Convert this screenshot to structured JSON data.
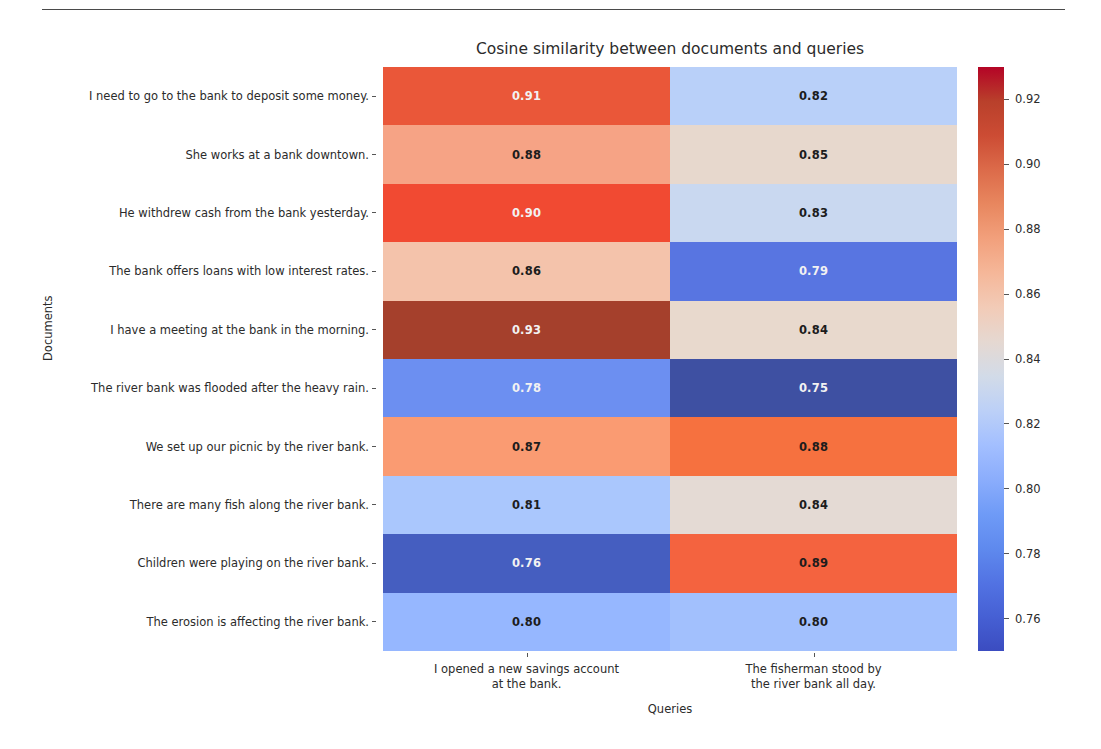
{
  "figure": {
    "title": "Cosine similarity between documents and queries",
    "xlabel": "Queries",
    "ylabel": "Documents",
    "divider": "horizontal-rule"
  },
  "chart_data": {
    "type": "heatmap",
    "title": "Cosine similarity between documents and queries",
    "xlabel": "Queries",
    "ylabel": "Documents",
    "grid": false,
    "colormap": "coolwarm",
    "vmin": 0.75,
    "vmax": 0.93,
    "colorbar": {
      "position": "right",
      "ticks": [
        0.76,
        0.78,
        0.8,
        0.82,
        0.84,
        0.86,
        0.88,
        0.9,
        0.92
      ],
      "ticklabels": [
        "0.76",
        "0.78",
        "0.80",
        "0.82",
        "0.84",
        "0.86",
        "0.88",
        "0.90",
        "0.92"
      ],
      "low_color": "#3b4cc0",
      "mid_color": "#dddcdb",
      "high_color": "#b40426"
    },
    "x_categories": [
      "I opened a new savings account at the bank.",
      "The fisherman stood by the river bank all day."
    ],
    "x_ticklabels": [
      [
        "I opened a new savings account",
        "at the bank."
      ],
      [
        "The fisherman stood by",
        "the river bank all day."
      ]
    ],
    "y_categories": [
      "I need to go to the bank to deposit some money.",
      "She works at a bank downtown.",
      "He withdrew cash from the bank yesterday.",
      "The bank offers loans with low interest rates.",
      "I have a meeting at the bank in the morning.",
      "The river bank was flooded after the heavy rain.",
      "We set up our picnic by the river bank.",
      "There are many fish along the river bank.",
      "Children were playing on the river bank.",
      "The erosion is affecting the river bank."
    ],
    "values": [
      [
        0.91,
        0.82
      ],
      [
        0.88,
        0.85
      ],
      [
        0.9,
        0.83
      ],
      [
        0.86,
        0.79
      ],
      [
        0.93,
        0.84
      ],
      [
        0.78,
        0.75
      ],
      [
        0.87,
        0.88
      ],
      [
        0.81,
        0.84
      ],
      [
        0.76,
        0.89
      ],
      [
        0.8,
        0.8
      ]
    ],
    "annotations": [
      [
        "0.91",
        "0.82"
      ],
      [
        "0.88",
        "0.85"
      ],
      [
        "0.90",
        "0.83"
      ],
      [
        "0.86",
        "0.79"
      ],
      [
        "0.93",
        "0.84"
      ],
      [
        "0.78",
        "0.75"
      ],
      [
        "0.87",
        "0.88"
      ],
      [
        "0.81",
        "0.84"
      ],
      [
        "0.76",
        "0.89"
      ],
      [
        "0.80",
        "0.80"
      ]
    ],
    "cell_colors": [
      [
        "#ea5739",
        "#b9d0f9"
      ],
      [
        "#f6a385",
        "#e7d8cd"
      ],
      [
        "#f14a32",
        "#c9d8f0"
      ],
      [
        "#f4c3ab",
        "#5875e1"
      ],
      [
        "#a5402c",
        "#e8d9cd"
      ],
      [
        "#6c8ff1",
        "#3e50a2"
      ],
      [
        "#fa9b72",
        "#f6713f"
      ],
      [
        "#aac7fd",
        "#e4dad4"
      ],
      [
        "#455ec0",
        "#f4633f"
      ],
      [
        "#96b7ff",
        "#a2c0fd"
      ]
    ],
    "cell_text_colors": [
      [
        "#f2f2f2",
        "#1c1c1c"
      ],
      [
        "#1c1c1c",
        "#1c1c1c"
      ],
      [
        "#f2f2f2",
        "#1c1c1c"
      ],
      [
        "#1c1c1c",
        "#f2f2f2"
      ],
      [
        "#f2f2f2",
        "#1c1c1c"
      ],
      [
        "#f2f2f2",
        "#f2f2f2"
      ],
      [
        "#1c1c1c",
        "#1c1c1c"
      ],
      [
        "#1c1c1c",
        "#1c1c1c"
      ],
      [
        "#f2f2f2",
        "#1c1c1c"
      ],
      [
        "#1c1c1c",
        "#1c1c1c"
      ]
    ]
  }
}
